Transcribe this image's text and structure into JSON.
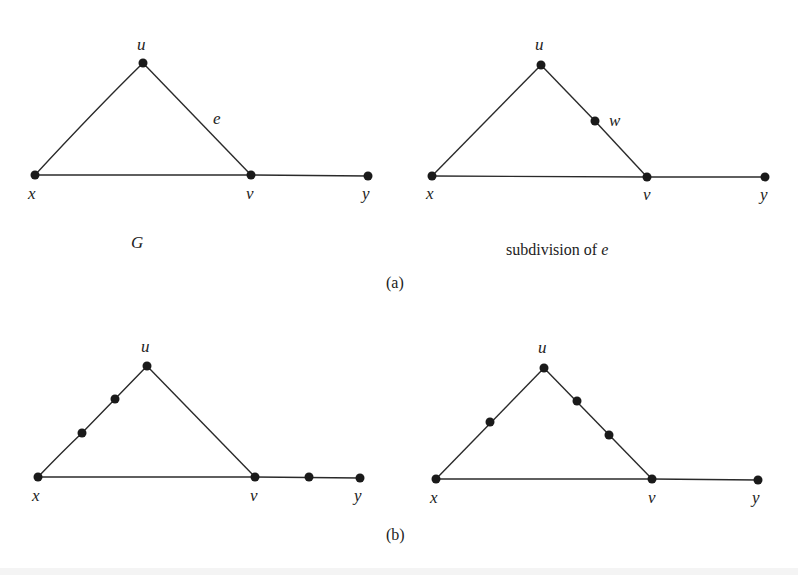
{
  "figure": {
    "part_a": {
      "label": "(a)",
      "left_graph": {
        "caption": "G",
        "nodes": [
          {
            "id": "u",
            "label": "u",
            "x": 143,
            "y": 63
          },
          {
            "id": "x",
            "label": "x",
            "x": 35,
            "y": 175
          },
          {
            "id": "v",
            "label": "v",
            "x": 251,
            "y": 175
          },
          {
            "id": "y",
            "label": "y",
            "x": 368,
            "y": 176
          }
        ],
        "edge_label": "e"
      },
      "right_graph": {
        "caption_prefix": "subdivision of ",
        "caption_var": "e",
        "nodes": [
          {
            "id": "u",
            "label": "u",
            "x": 541,
            "y": 65
          },
          {
            "id": "w",
            "label": "w",
            "x": 595,
            "y": 121
          },
          {
            "id": "x",
            "label": "x",
            "x": 432,
            "y": 176
          },
          {
            "id": "v",
            "label": "v",
            "x": 647,
            "y": 177
          },
          {
            "id": "y",
            "label": "y",
            "x": 765,
            "y": 177
          }
        ]
      }
    },
    "part_b": {
      "label": "(b)",
      "left_graph": {
        "nodes": [
          {
            "id": "u",
            "label": "u",
            "x": 147,
            "y": 366
          },
          {
            "id": "x",
            "label": "x",
            "x": 38,
            "y": 477
          },
          {
            "id": "v",
            "label": "v",
            "x": 255,
            "y": 477
          },
          {
            "id": "y",
            "label": "y",
            "x": 360,
            "y": 478
          }
        ],
        "subdivision_nodes": [
          {
            "x": 115,
            "y": 399
          },
          {
            "x": 82,
            "y": 433
          },
          {
            "x": 309,
            "y": 477
          }
        ]
      },
      "right_graph": {
        "nodes": [
          {
            "id": "u",
            "label": "u",
            "x": 544,
            "y": 368
          },
          {
            "id": "x",
            "label": "x",
            "x": 436,
            "y": 479
          },
          {
            "id": "v",
            "label": "v",
            "x": 652,
            "y": 479
          },
          {
            "id": "y",
            "label": "y",
            "x": 758,
            "y": 480
          }
        ],
        "subdivision_nodes": [
          {
            "x": 490,
            "y": 422
          },
          {
            "x": 577,
            "y": 401
          },
          {
            "x": 609,
            "y": 435
          }
        ]
      }
    }
  }
}
